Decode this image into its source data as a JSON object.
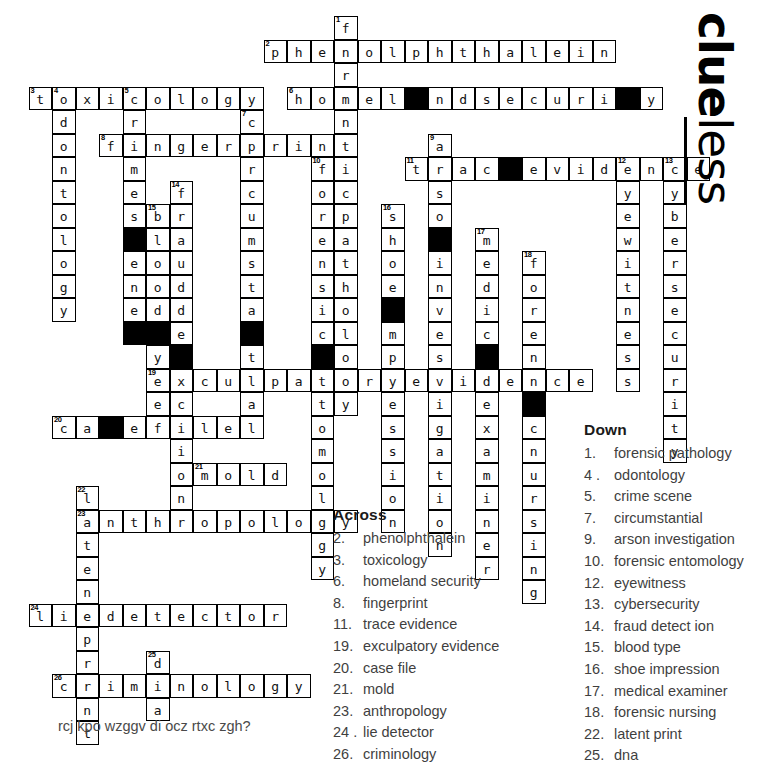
{
  "logo": {
    "part1": "clue",
    "part2": "less"
  },
  "footer": {
    "riddle": "rcj kpo wzggv di ocz rtxc zgh?"
  },
  "across": {
    "heading": "Across",
    "clues": [
      {
        "num": "2.",
        "text": "phenolphthalein"
      },
      {
        "num": "3.",
        "text": "toxicology"
      },
      {
        "num": "6.",
        "text": "homeland security"
      },
      {
        "num": "8.",
        "text": "fingerprint"
      },
      {
        "num": "11.",
        "text": "trace evidence"
      },
      {
        "num": "19.",
        "text": "exculpatory evidence"
      },
      {
        "num": "20.",
        "text": "case file"
      },
      {
        "num": "21.",
        "text": "mold"
      },
      {
        "num": "23.",
        "text": "anthropology"
      },
      {
        "num": "24 .",
        "text": "lie detector"
      },
      {
        "num": "26.",
        "text": "criminology"
      }
    ]
  },
  "down": {
    "heading": "Down",
    "clues": [
      {
        "num": "1.",
        "text": "forensic pathology"
      },
      {
        "num": "4 .",
        "text": "odontology"
      },
      {
        "num": "5.",
        "text": "crime scene"
      },
      {
        "num": "7.",
        "text": "circumstantial"
      },
      {
        "num": "9.",
        "text": "arson investigation"
      },
      {
        "num": "10.",
        "text": "forensic entomology"
      },
      {
        "num": "12.",
        "text": "eyewitness"
      },
      {
        "num": "13.",
        "text": "cybersecurity"
      },
      {
        "num": "14.",
        "text": "fraud detect ion"
      },
      {
        "num": "15.",
        "text": "blood type"
      },
      {
        "num": "16.",
        "text": "shoe impression"
      },
      {
        "num": "17.",
        "text": "medical examiner"
      },
      {
        "num": "18.",
        "text": "forensic nursing"
      },
      {
        "num": "22.",
        "text": "latent print"
      },
      {
        "num": "25.",
        "text": "dna"
      }
    ]
  },
  "grid": {
    "origin_x": 5,
    "origin_y": 16,
    "cell": 23.5,
    "entries": [
      {
        "num": "1",
        "dir": "down",
        "answer": "forensicpathology",
        "col": 14,
        "row": 0,
        "label": "forensic pathology"
      },
      {
        "num": "2",
        "dir": "across",
        "answer": "phenolphthalein",
        "col": 11,
        "row": 1,
        "label": "phenolphthalein"
      },
      {
        "num": "3",
        "dir": "across",
        "answer": "toxicology",
        "col": 1,
        "row": 3,
        "label": "toxicology"
      },
      {
        "num": "4",
        "dir": "down",
        "answer": "odontology",
        "col": 2,
        "row": 3,
        "label": "odontology"
      },
      {
        "num": "5",
        "dir": "down",
        "answer": "crimescene",
        "col": 5,
        "row": 3,
        "label": "crime scene"
      },
      {
        "num": "6",
        "dir": "across",
        "answer": "homelandsecurity",
        "col": 12,
        "row": 3,
        "label": "homeland security"
      },
      {
        "num": "7",
        "dir": "down",
        "answer": "circumstantial",
        "col": 10,
        "row": 4,
        "label": "circumstantial"
      },
      {
        "num": "8",
        "dir": "across",
        "answer": "fingerprint",
        "col": 4,
        "row": 5,
        "label": "fingerprint"
      },
      {
        "num": "9",
        "dir": "down",
        "answer": "arsoninvestigation",
        "col": 18,
        "row": 5,
        "label": "arson investigation"
      },
      {
        "num": "10",
        "dir": "down",
        "answer": "forensicentomology",
        "col": 13,
        "row": 6,
        "label": "forensic entomology"
      },
      {
        "num": "11",
        "dir": "across",
        "answer": "traceevidence",
        "col": 17,
        "row": 6,
        "label": "trace evidence"
      },
      {
        "num": "12",
        "dir": "down",
        "answer": "eyewitness",
        "col": 26,
        "row": 6,
        "label": "eyewitness"
      },
      {
        "num": "13",
        "dir": "down",
        "answer": "cybersecurity",
        "col": 28,
        "row": 6,
        "label": "cybersecurity"
      },
      {
        "num": "14",
        "dir": "down",
        "answer": "frauddetection",
        "col": 7,
        "row": 7,
        "label": "fraud detect ion"
      },
      {
        "num": "15",
        "dir": "down",
        "answer": "bloodtype",
        "col": 6,
        "row": 8,
        "label": "blood type"
      },
      {
        "num": "16",
        "dir": "down",
        "answer": "shoeimpression",
        "col": 16,
        "row": 8,
        "label": "shoe impression"
      },
      {
        "num": "17",
        "dir": "down",
        "answer": "medicalexaminer",
        "col": 20,
        "row": 9,
        "label": "medical examiner"
      },
      {
        "num": "18",
        "dir": "down",
        "answer": "forensicnursing",
        "col": 22,
        "row": 10,
        "label": "forensic nursing"
      },
      {
        "num": "19",
        "dir": "across",
        "answer": "exculpatoryevidence",
        "col": 6,
        "row": 15,
        "label": "exculpatory evidence"
      },
      {
        "num": "20",
        "dir": "across",
        "answer": "casefile",
        "col": 2,
        "row": 17,
        "label": "case file"
      },
      {
        "num": "21",
        "dir": "across",
        "answer": "mold",
        "col": 8,
        "row": 19,
        "label": "mold"
      },
      {
        "num": "22",
        "dir": "down",
        "answer": "latentprint",
        "col": 3,
        "row": 20,
        "label": "latent print"
      },
      {
        "num": "23",
        "dir": "across",
        "answer": "anthropology",
        "col": 3,
        "row": 21,
        "label": "anthropology"
      },
      {
        "num": "24",
        "dir": "across",
        "answer": "liedetector",
        "col": 1,
        "row": 25,
        "label": "lie detector"
      },
      {
        "num": "25",
        "dir": "down",
        "answer": "dna",
        "col": 6,
        "row": 27,
        "label": "dna"
      },
      {
        "num": "26",
        "dir": "across",
        "answer": "criminology",
        "col": 2,
        "row": 28,
        "label": "criminology"
      }
    ],
    "blocks": [
      {
        "col": 5,
        "row": 9
      },
      {
        "col": 6,
        "row": 13
      },
      {
        "col": 5,
        "row": 13
      },
      {
        "col": 7,
        "row": 14
      },
      {
        "col": 10,
        "row": 13
      },
      {
        "col": 13,
        "row": 14
      },
      {
        "col": 16,
        "row": 12
      },
      {
        "col": 17,
        "row": 3
      },
      {
        "col": 18,
        "row": 9
      },
      {
        "col": 20,
        "row": 14
      },
      {
        "col": 21,
        "row": 6
      },
      {
        "col": 22,
        "row": 16
      },
      {
        "col": 26,
        "row": 3
      },
      {
        "col": 4,
        "row": 17
      }
    ]
  }
}
